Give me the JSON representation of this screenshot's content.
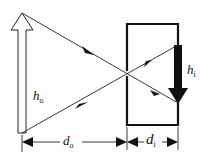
{
  "diagram": {
    "labels": {
      "object_height": {
        "main": "h",
        "sub": "o"
      },
      "image_height": {
        "main": "h",
        "sub": "i"
      },
      "object_distance": {
        "main": "d",
        "sub": "o"
      },
      "image_distance": {
        "main": "d",
        "sub": "i"
      }
    },
    "elements": {
      "object": "hollow upright arrow (object)",
      "camera": "box with pinhole",
      "image": "solid inverted arrow (image)",
      "rays": [
        "ray from object top to image bottom",
        "ray from object bottom to image top"
      ]
    },
    "colors": {
      "stroke": "#111111",
      "background": "#ffffff"
    }
  }
}
